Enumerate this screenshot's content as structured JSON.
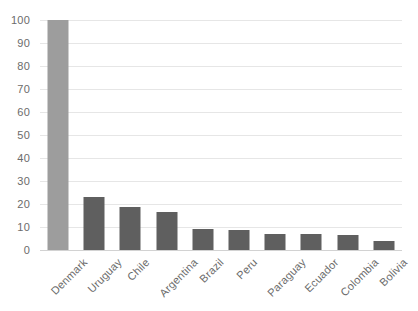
{
  "chart_data": {
    "type": "bar",
    "title": "",
    "subtitle": "",
    "xlabel": "",
    "ylabel": "",
    "categories": [
      "Denmark",
      "Uruguay",
      "Chile",
      "Argentina",
      "Brazil",
      "Peru",
      "Paraguay",
      "Ecuador",
      "Colombia",
      "Bolivia"
    ],
    "values": [
      100,
      23,
      18.5,
      16.5,
      9,
      8.8,
      7,
      6.8,
      6.5,
      4
    ],
    "series": [
      {
        "name": "Value",
        "values": [
          100,
          23,
          18.5,
          16.5,
          9,
          8.8,
          7,
          6.8,
          6.5,
          4
        ]
      }
    ],
    "ylim": [
      0,
      100
    ],
    "y_ticks": [
      0,
      10,
      20,
      30,
      40,
      50,
      60,
      70,
      80,
      90,
      100
    ],
    "y_tick_labels": [
      "0",
      "10",
      "20",
      "30",
      "40",
      "50",
      "60",
      "70",
      "80",
      "90",
      "100"
    ],
    "grid": true,
    "grid_axis": "y",
    "legend": false,
    "legend_position": "none",
    "x_tick_rotation": -45,
    "bar_colors": [
      "#9d9d9d",
      "#5f5f5f",
      "#5f5f5f",
      "#5f5f5f",
      "#5f5f5f",
      "#5f5f5f",
      "#5f5f5f",
      "#5f5f5f",
      "#5f5f5f",
      "#5f5f5f"
    ],
    "highlight_color": "#9d9d9d",
    "bar_color": "#5f5f5f",
    "gridline_color": "#e6e6e6",
    "axis_color": "#d2d2d2",
    "tick_label_color": "#6b6b6b",
    "background_color": "#ffffff"
  }
}
